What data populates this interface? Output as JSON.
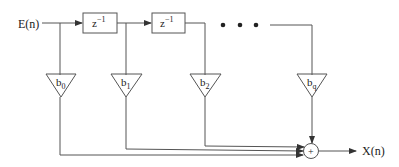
{
  "diagram": {
    "input_label": "E(n)",
    "output_label": "X(n)",
    "delays": [
      {
        "label": "z",
        "exp": "−1"
      },
      {
        "label": "z",
        "exp": "−1"
      }
    ],
    "ellipsis": "• • •",
    "summer_symbol": "+",
    "coefficients": [
      {
        "base": "b",
        "sub": "0"
      },
      {
        "base": "b",
        "sub": "1"
      },
      {
        "base": "b",
        "sub": "2"
      },
      {
        "base": "b",
        "sub": "q"
      }
    ],
    "colors": {
      "line": "#555555",
      "text": "#222222",
      "background": "#ffffff"
    }
  }
}
